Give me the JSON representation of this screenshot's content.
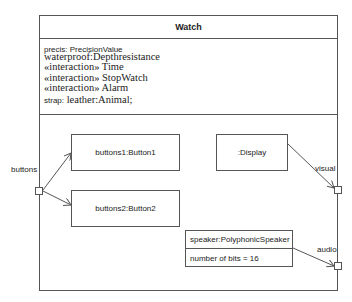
{
  "diagram": {
    "type": "UML composite structure diagram",
    "classifier": {
      "name": "Watch",
      "attributes": [
        {
          "name_part": "precis:",
          "type_part": " PrecisionValue",
          "style": "sans"
        },
        {
          "text": "waterproof:Depthresistance",
          "style": "serif"
        },
        {
          "text": "«interaction» Time",
          "style": "serif"
        },
        {
          "text": "«interaction» StopWatch",
          "style": "serif"
        },
        {
          "text": "«interaction» Alarm",
          "style": "serif"
        },
        {
          "name_part": "strap:",
          "type_part": " leather:Animal;",
          "style": "mixed"
        }
      ]
    },
    "parts": [
      {
        "id": "buttons1",
        "label": "buttons1:Button1"
      },
      {
        "id": "buttons2",
        "label": "buttons2:Button2"
      },
      {
        "id": "display",
        "label": ":Display"
      },
      {
        "id": "speaker",
        "label": "speaker:PolyphonicSpeaker",
        "attribute": "number of bits = 16"
      }
    ],
    "ports": [
      {
        "id": "buttons",
        "label": "buttons",
        "side": "left"
      },
      {
        "id": "visual",
        "label": "visual",
        "side": "right"
      },
      {
        "id": "audio",
        "label": "audio",
        "side": "right"
      }
    ],
    "connectors": [
      {
        "from": "buttons",
        "to": "buttons1",
        "arrow": "open"
      },
      {
        "from": "buttons",
        "to": "buttons2",
        "arrow": "open"
      },
      {
        "from": "display",
        "to": "visual",
        "arrow": "open"
      },
      {
        "from": "speaker",
        "to": "audio",
        "arrow": "open"
      }
    ],
    "colors": {
      "line": "#555555",
      "text": "#222222",
      "background": "#ffffff"
    }
  }
}
